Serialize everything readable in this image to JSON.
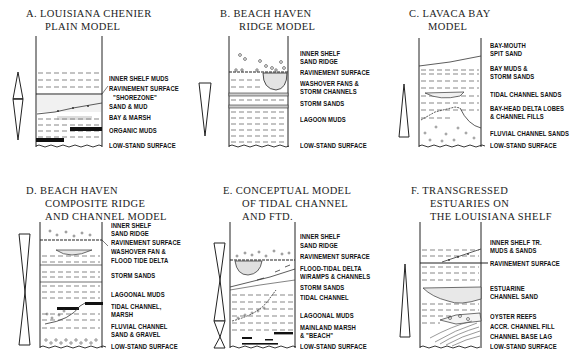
{
  "figure": {
    "panels": [
      {
        "id": "A",
        "title_lines": [
          "A.  LOUISIANA CHENIER",
          "PLAIN MODEL"
        ],
        "labels": [
          "INNER SHELF MUDS",
          "RAVINEMENT SURFACE",
          "\"SHOREZONE\"",
          "SAND & MUD",
          "BAY & MARSH",
          "ORGANIC MUDS",
          "LOW-STAND SURFACE"
        ],
        "arrow_symbol": "double-arrow-up-down"
      },
      {
        "id": "B",
        "title_lines": [
          "B.  BEACH HAVEN",
          "RIDGE MODEL"
        ],
        "labels": [
          "INNER SHELF",
          "SAND RIDGE",
          "RAVINEMENT SURFACE",
          "WASHOVER FANS &",
          "STORM CHANNELS",
          "STORM SANDS",
          "LAGOON MUDS",
          "LOW-STAND SURFACE"
        ],
        "arrow_symbol": "downward-wedge"
      },
      {
        "id": "C",
        "title_lines": [
          "C.  LAVACA BAY",
          "MODEL"
        ],
        "labels": [
          "BAY-MOUTH",
          "SPIT SAND",
          "BAY MUDS &",
          "STORM SANDS",
          "TIDAL CHANNEL SANDS",
          "BAY-HEAD DELTA LOBES",
          "& CHANNEL FILLS",
          "FLUVIAL CHANNEL SANDS",
          "LOW-STAND SURFACE"
        ],
        "arrow_symbol": "upward-wedge"
      },
      {
        "id": "D",
        "title_lines": [
          "D.  BEACH HAVEN",
          "COMPOSITE RIDGE",
          "AND CHANNEL MODEL"
        ],
        "labels": [
          "INNER SHELF",
          "SAND RIDGE",
          "RAVINEMENT SURFACE",
          "WASHOVER FAN &",
          "FLOOD TIDE DELTA",
          "STORM SANDS",
          "LAGOONAL MUDS",
          "TIDAL CHANNEL,",
          "MARSH",
          "FLUVIAL CHANNEL",
          "SAND & GRAVEL",
          "LOW-STAND SURFACE"
        ],
        "arrow_symbol": "hourglass-wedge"
      },
      {
        "id": "E",
        "title_lines": [
          "E.  CONCEPTUAL MODEL",
          "OF TIDAL CHANNEL",
          "AND FTD."
        ],
        "labels": [
          "INNER SHELF",
          "SAND RIDGE",
          "RAVINEMENT SURFACE",
          "FLOOD-TIDAL DELTA",
          "W/RAMPS & CHANNELS",
          "STORM SANDS",
          "TIDAL CHANNEL",
          "LAGOONAL MUDS",
          "MAINLAND MARSH",
          "& \"BEACH\"",
          "LOW-STAND SURFACE"
        ],
        "arrow_symbol": "double-hourglass-wedge"
      },
      {
        "id": "F",
        "title_lines": [
          "F.  TRANSGRESSED",
          "ESTUARIES ON",
          "THE LOUISIANA SHELF"
        ],
        "labels": [
          "INNER SHELF TR.",
          "MUDS & SANDS",
          "RAVINEMENT SURFACE",
          "ESTUARINE",
          "CHANNEL SAND",
          "OYSTER REEFS",
          "ACCR. CHANNEL FILL",
          "CHANNEL BASE LAG",
          "LOW-STAND SURFACE"
        ],
        "arrow_symbol": "upward-wedge"
      }
    ]
  }
}
